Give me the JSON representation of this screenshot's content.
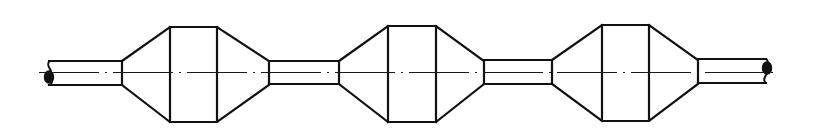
{
  "figure": {
    "width": 825,
    "height": 139,
    "background": "#ffffff",
    "stroke_color": "#111111"
  },
  "centerline": {
    "y": 72.5,
    "x_start": 39,
    "x_end": 778,
    "dash_pattern": "60 6 2 6"
  },
  "shafts": [
    {
      "name": "shaft-left-end",
      "x1": 49,
      "x2": 122,
      "y_top": 61,
      "y_bottom": 85
    },
    {
      "name": "shaft-middle-1",
      "x1": 269,
      "x2": 339,
      "y_top": 61,
      "y_bottom": 84
    },
    {
      "name": "shaft-middle-2",
      "x1": 484,
      "x2": 552,
      "y_top": 60,
      "y_bottom": 84
    },
    {
      "name": "shaft-right-end",
      "x1": 698,
      "x2": 766,
      "y_top": 59,
      "y_bottom": 83
    }
  ],
  "drums": [
    {
      "name": "drum-1",
      "cone_left_x": 122,
      "cyl_left_x": 170,
      "cyl_right_x": 217,
      "cone_right_x": 269,
      "small_top": 61,
      "small_bottom": 85,
      "top": 27,
      "bottom": 122
    },
    {
      "name": "drum-2",
      "cone_left_x": 339,
      "cyl_left_x": 388,
      "cyl_right_x": 436,
      "cone_right_x": 484,
      "small_top": 61,
      "small_bottom": 84,
      "top": 26,
      "bottom": 122
    },
    {
      "name": "drum-3",
      "cone_left_x": 552,
      "cyl_left_x": 602,
      "cyl_right_x": 649,
      "cone_right_x": 698,
      "small_top": 60,
      "small_bottom": 84,
      "top": 25,
      "bottom": 121
    }
  ],
  "break_symbols": [
    {
      "name": "left-break",
      "x": 50,
      "y_top": 61,
      "y_bottom": 85,
      "side": "left"
    },
    {
      "name": "right-break",
      "x": 766,
      "y_top": 59,
      "y_bottom": 83,
      "side": "right"
    }
  ]
}
